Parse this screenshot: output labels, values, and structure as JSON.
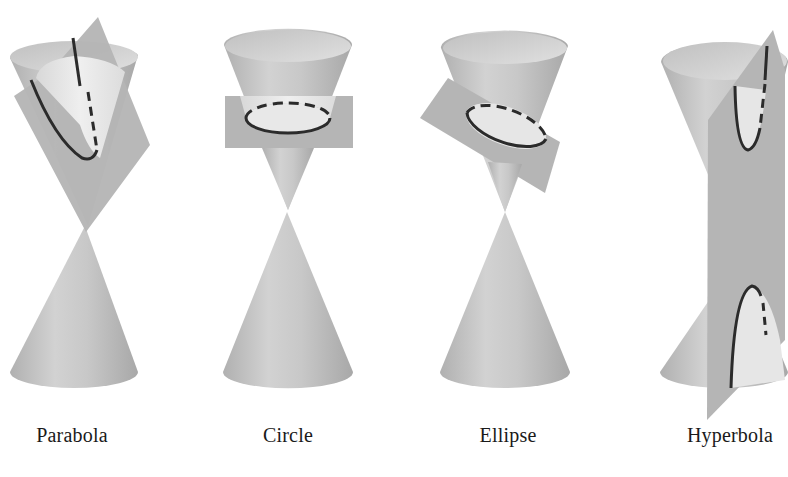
{
  "figure": {
    "colors": {
      "background": "#ffffff",
      "cone_light": "#e6e6e6",
      "cone_mid": "#c4c4c4",
      "cone_dark": "#a9a9a9",
      "plane": "#b3b3b3",
      "curve": "#2b2b2b"
    },
    "panels": [
      {
        "id": "parabola",
        "label": "Parabola",
        "label_x": 72
      },
      {
        "id": "circle",
        "label": "Circle",
        "label_x": 288
      },
      {
        "id": "ellipse",
        "label": "Ellipse",
        "label_x": 508
      },
      {
        "id": "hyperbola",
        "label": "Hyperbola",
        "label_x": 730
      }
    ]
  }
}
